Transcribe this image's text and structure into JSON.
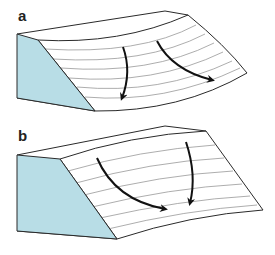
{
  "panels": [
    {
      "label": "a",
      "description": "block diagram with diverging curved surface, arrows pointing down-slope and diverging",
      "face_color": "#b8dde6",
      "arrows": 2
    },
    {
      "label": "b",
      "description": "block diagram with converging concave surface, arrows converging down-slope",
      "face_color": "#b8dde6",
      "arrows": 2
    }
  ],
  "colors": {
    "face_fill": "#b8dde6",
    "outline": "#2a2a2a",
    "contour": "#8a8a8a",
    "arrow": "#111111"
  }
}
